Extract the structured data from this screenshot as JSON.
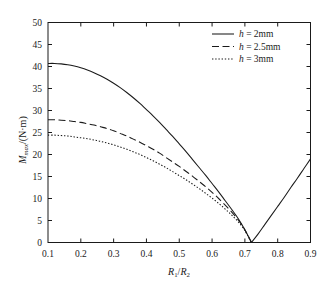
{
  "chart_data": {
    "type": "line",
    "title": "",
    "xlabel": "R1/R2",
    "xlabel_parts": {
      "main1": "R",
      "sub1": "1",
      "slash": "/",
      "main2": "R",
      "sub2": "2"
    },
    "ylabel": "Mmax/(N·m)",
    "ylabel_parts": {
      "main": "M",
      "sub": "max",
      "unit": "/(N·m)"
    },
    "xlim": [
      0.1,
      0.9
    ],
    "ylim": [
      0,
      50
    ],
    "xticks": [
      "0.1",
      "0.2",
      "0.3",
      "0.4",
      "0.5",
      "0.6",
      "0.7",
      "0.8",
      "0.9"
    ],
    "xtick_values": [
      0.1,
      0.2,
      0.3,
      0.4,
      0.5,
      0.6,
      0.7,
      0.8,
      0.9
    ],
    "yticks": [
      "0",
      "5",
      "10",
      "15",
      "20",
      "25",
      "30",
      "35",
      "40",
      "45",
      "50"
    ],
    "ytick_values": [
      0,
      5,
      10,
      15,
      20,
      25,
      30,
      35,
      40,
      45,
      50
    ],
    "grid": false,
    "legend_position": "top-right",
    "zero_crossing_x": 0.72,
    "series": [
      {
        "name": "h = 2mm",
        "style": "solid",
        "color": "#1a1a1a",
        "x": [
          0.1,
          0.12,
          0.14,
          0.16,
          0.18,
          0.2,
          0.22,
          0.24,
          0.26,
          0.28,
          0.3,
          0.32,
          0.34,
          0.36,
          0.38,
          0.4,
          0.42,
          0.44,
          0.46,
          0.48,
          0.5,
          0.52,
          0.54,
          0.56,
          0.58,
          0.6,
          0.62,
          0.64,
          0.66,
          0.68,
          0.7,
          0.72,
          0.74,
          0.76,
          0.78,
          0.8,
          0.82,
          0.84,
          0.86,
          0.88,
          0.9
        ],
        "values": [
          40.7,
          40.7,
          40.6,
          40.4,
          40.1,
          39.7,
          39.2,
          38.6,
          37.9,
          37.1,
          36.2,
          35.2,
          34.1,
          32.9,
          31.6,
          30.2,
          28.8,
          27.3,
          25.7,
          24.1,
          22.4,
          20.7,
          18.9,
          17.1,
          15.3,
          13.4,
          11.5,
          9.5,
          7.5,
          5.4,
          2.9,
          0.0,
          1.9,
          4.0,
          6.1,
          8.2,
          10.3,
          12.5,
          14.6,
          16.8,
          19.0
        ]
      },
      {
        "name": "h = 2.5mm",
        "style": "dashed",
        "color": "#1a1a1a",
        "x": [
          0.1,
          0.12,
          0.14,
          0.16,
          0.18,
          0.2,
          0.22,
          0.24,
          0.26,
          0.28,
          0.3,
          0.32,
          0.34,
          0.36,
          0.38,
          0.4,
          0.42,
          0.44,
          0.46,
          0.48,
          0.5,
          0.52,
          0.54,
          0.56,
          0.58,
          0.6,
          0.62,
          0.64,
          0.66,
          0.68,
          0.7,
          0.72,
          0.74,
          0.76,
          0.78,
          0.8,
          0.82,
          0.84,
          0.86,
          0.88,
          0.9
        ],
        "values": [
          27.9,
          27.9,
          27.8,
          27.7,
          27.5,
          27.3,
          27.0,
          26.7,
          26.3,
          25.9,
          25.4,
          24.8,
          24.2,
          23.5,
          22.8,
          22.0,
          21.2,
          20.3,
          19.3,
          18.3,
          17.3,
          16.2,
          15.1,
          13.9,
          12.7,
          11.4,
          10.0,
          8.5,
          6.9,
          5.1,
          2.9,
          0.0,
          1.9,
          4.0,
          6.1,
          8.2,
          10.3,
          12.5,
          14.6,
          16.8,
          19.0
        ]
      },
      {
        "name": "h = 3mm",
        "style": "dotted",
        "color": "#1a1a1a",
        "x": [
          0.1,
          0.12,
          0.14,
          0.16,
          0.18,
          0.2,
          0.22,
          0.24,
          0.26,
          0.28,
          0.3,
          0.32,
          0.34,
          0.36,
          0.38,
          0.4,
          0.42,
          0.44,
          0.46,
          0.48,
          0.5,
          0.52,
          0.54,
          0.56,
          0.58,
          0.6,
          0.62,
          0.64,
          0.66,
          0.68,
          0.7,
          0.72,
          0.74,
          0.76,
          0.78,
          0.8,
          0.82,
          0.84,
          0.86,
          0.88,
          0.9
        ],
        "values": [
          24.4,
          24.4,
          24.3,
          24.2,
          24.0,
          23.8,
          23.6,
          23.3,
          23.0,
          22.6,
          22.2,
          21.7,
          21.2,
          20.6,
          20.0,
          19.3,
          18.6,
          17.8,
          17.0,
          16.1,
          15.2,
          14.3,
          13.3,
          12.3,
          11.2,
          10.1,
          8.9,
          7.6,
          6.2,
          4.7,
          2.7,
          0.0,
          1.9,
          4.0,
          6.1,
          8.2,
          10.3,
          12.5,
          14.6,
          16.8,
          19.0
        ]
      }
    ],
    "legend": [
      {
        "label_prefix": "h",
        "label_rest": " = 2mm",
        "style": "solid"
      },
      {
        "label_prefix": "h",
        "label_rest": " = 2.5mm",
        "style": "dashed"
      },
      {
        "label_prefix": "h",
        "label_rest": " = 3mm",
        "style": "dotted"
      }
    ]
  }
}
